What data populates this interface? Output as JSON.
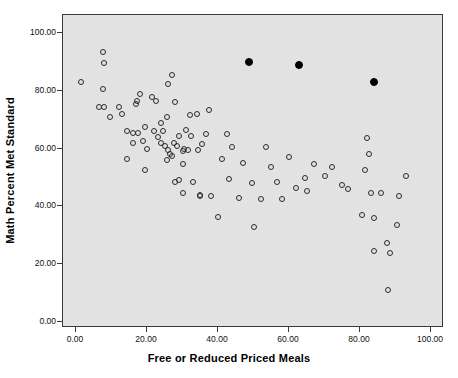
{
  "chart_data": {
    "type": "scatter",
    "title": "",
    "xlabel": "Free or Reduced Priced Meals",
    "ylabel": "Math Percent Met Standard",
    "xlim": [
      -5,
      105
    ],
    "ylim": [
      -5,
      105
    ],
    "grid": false,
    "legend": null,
    "xticks": [
      "0.00",
      "20.00",
      "40.00",
      "60.00",
      "80.00",
      "100.00"
    ],
    "xtick_values": [
      0,
      20,
      40,
      60,
      80,
      100
    ],
    "yticks": [
      "0.00",
      "20.00",
      "40.00",
      "60.00",
      "80.00",
      "100.00"
    ],
    "ytick_values": [
      0,
      20,
      40,
      60,
      80,
      100
    ],
    "plot_background": "#e2e2e2",
    "marker_edge_color": "#2b2b2b",
    "highlight_color": "#000000",
    "series": [
      {
        "name": "schools",
        "marker": "open-circle",
        "points": [
          [
            1.5,
            83.0
          ],
          [
            7.5,
            93.5
          ],
          [
            7.8,
            89.5
          ],
          [
            7.5,
            80.5
          ],
          [
            6.5,
            74.5
          ],
          [
            8.0,
            74.5
          ],
          [
            9.5,
            71.0
          ],
          [
            12.0,
            74.5
          ],
          [
            13.0,
            72.0
          ],
          [
            14.5,
            66.0
          ],
          [
            16.0,
            65.5
          ],
          [
            17.5,
            65.5
          ],
          [
            18.0,
            79.0
          ],
          [
            16.8,
            75.5
          ],
          [
            17.2,
            76.5
          ],
          [
            19.5,
            67.5
          ],
          [
            21.5,
            78.0
          ],
          [
            22.5,
            76.5
          ],
          [
            16.0,
            62.0
          ],
          [
            14.5,
            56.5
          ],
          [
            19.0,
            62.5
          ],
          [
            20.0,
            60.0
          ],
          [
            19.5,
            52.5
          ],
          [
            22.0,
            66.0
          ],
          [
            23.0,
            64.0
          ],
          [
            24.0,
            69.0
          ],
          [
            24.5,
            66.0
          ],
          [
            25.5,
            71.0
          ],
          [
            26.0,
            82.5
          ],
          [
            27.0,
            85.5
          ],
          [
            28.0,
            76.0
          ],
          [
            24.0,
            62.0
          ],
          [
            25.0,
            61.0
          ],
          [
            26.0,
            59.5
          ],
          [
            26.5,
            58.0
          ],
          [
            27.5,
            62.0
          ],
          [
            28.5,
            61.0
          ],
          [
            25.5,
            56.0
          ],
          [
            27.0,
            57.5
          ],
          [
            29.0,
            64.5
          ],
          [
            30.0,
            59.0
          ],
          [
            30.5,
            60.0
          ],
          [
            31.0,
            66.5
          ],
          [
            32.0,
            71.5
          ],
          [
            32.5,
            64.5
          ],
          [
            31.5,
            59.5
          ],
          [
            30.0,
            54.5
          ],
          [
            28.0,
            48.5
          ],
          [
            30.0,
            44.5
          ],
          [
            33.0,
            48.5
          ],
          [
            35.0,
            43.5
          ],
          [
            29.0,
            49.0
          ],
          [
            34.5,
            59.5
          ],
          [
            35.5,
            61.5
          ],
          [
            36.5,
            65.0
          ],
          [
            34.0,
            72.0
          ],
          [
            37.5,
            73.5
          ],
          [
            35.0,
            44.0
          ],
          [
            38.0,
            43.5
          ],
          [
            40.0,
            36.5
          ],
          [
            41.0,
            56.5
          ],
          [
            42.5,
            65.0
          ],
          [
            44.0,
            60.5
          ],
          [
            43.0,
            49.5
          ],
          [
            46.0,
            43.0
          ],
          [
            47.0,
            55.0
          ],
          [
            49.5,
            48.0
          ],
          [
            52.0,
            42.5
          ],
          [
            53.5,
            60.5
          ],
          [
            55.0,
            53.5
          ],
          [
            56.5,
            48.5
          ],
          [
            50.0,
            33.0
          ],
          [
            58.0,
            42.5
          ],
          [
            60.0,
            57.0
          ],
          [
            62.0,
            46.5
          ],
          [
            64.5,
            50.0
          ],
          [
            65.0,
            45.5
          ],
          [
            67.0,
            54.5
          ],
          [
            70.0,
            50.5
          ],
          [
            72.0,
            53.5
          ],
          [
            75.0,
            47.5
          ],
          [
            76.5,
            46.0
          ],
          [
            82.0,
            63.5
          ],
          [
            82.5,
            58.0
          ],
          [
            81.5,
            52.5
          ],
          [
            83.0,
            44.5
          ],
          [
            86.0,
            44.5
          ],
          [
            80.5,
            37.0
          ],
          [
            84.0,
            36.0
          ],
          [
            87.5,
            27.5
          ],
          [
            88.5,
            24.0
          ],
          [
            84.0,
            24.5
          ],
          [
            88.0,
            11.0
          ],
          [
            91.0,
            43.5
          ],
          [
            93.0,
            50.5
          ],
          [
            90.5,
            33.5
          ]
        ]
      },
      {
        "name": "highlighted",
        "marker": "filled-circle",
        "points": [
          [
            48.7,
            90.0
          ],
          [
            62.8,
            89.0
          ],
          [
            83.9,
            83.0
          ]
        ]
      }
    ]
  }
}
